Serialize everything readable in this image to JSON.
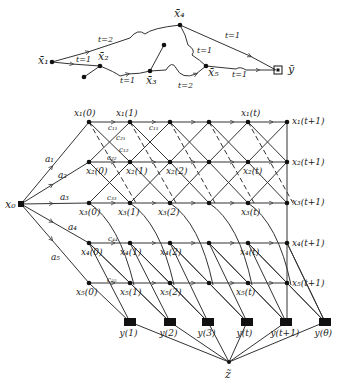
{
  "top_graph": {
    "nodes": [
      {
        "id": "x1",
        "label": "x̄₁",
        "x": 52,
        "y": 62
      },
      {
        "id": "x2",
        "label": "x̄₂",
        "x": 100,
        "y": 66
      },
      {
        "id": "x3",
        "label": "x̄₃",
        "x": 150,
        "y": 71
      },
      {
        "id": "x4",
        "label": "x̄₄",
        "x": 180,
        "y": 25
      },
      {
        "id": "x5",
        "label": "x̄₅",
        "x": 206,
        "y": 66
      },
      {
        "id": "y",
        "label": "ȳ",
        "x": 278,
        "y": 70
      }
    ],
    "edge_labels": [
      {
        "text": "t=2",
        "x": 98,
        "y": 42
      },
      {
        "text": "t=1",
        "x": 76,
        "y": 62
      },
      {
        "text": "t=1",
        "x": 120,
        "y": 83
      },
      {
        "text": "t=2",
        "x": 178,
        "y": 88
      },
      {
        "text": "t=1",
        "x": 197,
        "y": 53
      },
      {
        "text": "t=1",
        "x": 225,
        "y": 38
      },
      {
        "text": "t=1",
        "x": 232,
        "y": 77
      }
    ]
  },
  "main_graph": {
    "source": {
      "label": "x₀",
      "x": 21,
      "y": 204
    },
    "sink": {
      "label": "z̃",
      "x": 229,
      "y": 362
    },
    "column_x": [
      89,
      130,
      170,
      209,
      248,
      287
    ],
    "row_y": [
      122,
      162,
      203,
      243,
      283
    ],
    "node_labels": [
      {
        "text": "x₁(0)",
        "x": 74,
        "y": 116
      },
      {
        "text": "x₁(1)",
        "x": 116,
        "y": 116
      },
      {
        "text": "x₁(t)",
        "x": 241,
        "y": 116
      },
      {
        "text": "x₁(t+1)",
        "x": 292,
        "y": 124
      },
      {
        "text": "x₂(0)",
        "x": 86,
        "y": 174
      },
      {
        "text": "x₂(1)",
        "x": 126,
        "y": 174
      },
      {
        "text": "x₂(2)",
        "x": 166,
        "y": 174
      },
      {
        "text": "x₂(t)",
        "x": 243,
        "y": 174
      },
      {
        "text": "x₂(t+1)",
        "x": 292,
        "y": 165
      },
      {
        "text": "x₃(0)",
        "x": 79,
        "y": 215
      },
      {
        "text": "x₃(1)",
        "x": 118,
        "y": 215
      },
      {
        "text": "x₃(2)",
        "x": 158,
        "y": 215
      },
      {
        "text": "x₃(t)",
        "x": 241,
        "y": 215
      },
      {
        "text": "x₃(t+1)",
        "x": 292,
        "y": 205
      },
      {
        "text": "x₄(0)",
        "x": 81,
        "y": 255
      },
      {
        "text": "x₄(1)",
        "x": 120,
        "y": 255
      },
      {
        "text": "x₄(2)",
        "x": 160,
        "y": 255
      },
      {
        "text": "x₄(t)",
        "x": 240,
        "y": 255
      },
      {
        "text": "x₄(t+1)",
        "x": 292,
        "y": 246
      },
      {
        "text": "x₅(0)",
        "x": 76,
        "y": 295
      },
      {
        "text": "x₅(1)",
        "x": 120,
        "y": 295
      },
      {
        "text": "x₅(2)",
        "x": 160,
        "y": 295
      },
      {
        "text": "x₅(t)",
        "x": 236,
        "y": 295
      },
      {
        "text": "x₅(t+1)",
        "x": 292,
        "y": 286
      }
    ],
    "source_edge_labels": [
      {
        "text": "a₁",
        "x": 45,
        "y": 162
      },
      {
        "text": "a₂",
        "x": 58,
        "y": 178
      },
      {
        "text": "a₃",
        "x": 60,
        "y": 200
      },
      {
        "text": "a₄",
        "x": 68,
        "y": 230
      },
      {
        "text": "a₅",
        "x": 51,
        "y": 260
      }
    ],
    "coef_labels": [
      {
        "text": "c₁₁",
        "x": 108,
        "y": 130
      },
      {
        "text": "c₁₁",
        "x": 149,
        "y": 130
      },
      {
        "text": "c₂₁",
        "x": 116,
        "y": 140
      },
      {
        "text": "c₁₂",
        "x": 119,
        "y": 152
      },
      {
        "text": "c₂₂",
        "x": 107,
        "y": 160
      },
      {
        "text": "c₃₃",
        "x": 107,
        "y": 200
      },
      {
        "text": "c₄₄",
        "x": 108,
        "y": 241
      },
      {
        "text": "c₅₅",
        "x": 107,
        "y": 282
      }
    ],
    "outputs": [
      {
        "label": "y(1)",
        "x": 130,
        "y": 322
      },
      {
        "label": "y(2)",
        "x": 170,
        "y": 322
      },
      {
        "label": "y(3)",
        "x": 208,
        "y": 322
      },
      {
        "label": "y(t)",
        "x": 247,
        "y": 322
      },
      {
        "label": "y(t+1)",
        "x": 286,
        "y": 322
      },
      {
        "label": "y(θ)",
        "x": 325,
        "y": 322
      }
    ]
  }
}
